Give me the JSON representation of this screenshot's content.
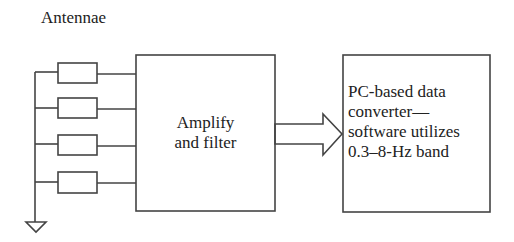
{
  "title": "Antennae",
  "blocks": {
    "amplifier": {
      "lines": [
        "Amplify",
        "and filter"
      ]
    },
    "converter": {
      "lines": [
        "PC-based data",
        "converter—",
        "software utilizes",
        "0.3–8-Hz band"
      ]
    }
  },
  "antenna_count": 4,
  "colors": {
    "stroke": "#444444",
    "text": "#222222",
    "background": "#ffffff"
  }
}
